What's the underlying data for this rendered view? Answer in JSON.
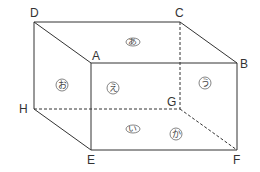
{
  "diagram": {
    "type": "rectangular-prism",
    "line_color": "#333333",
    "circle_color": "#666666",
    "vertices": {
      "A": {
        "label": "A",
        "x": 91,
        "y": 63
      },
      "B": {
        "label": "B",
        "x": 237,
        "y": 63
      },
      "C": {
        "label": "C",
        "x": 180,
        "y": 22
      },
      "D": {
        "label": "D",
        "x": 34,
        "y": 22
      },
      "E": {
        "label": "E",
        "x": 91,
        "y": 150
      },
      "F": {
        "label": "F",
        "x": 237,
        "y": 150
      },
      "G": {
        "label": "G",
        "x": 180,
        "y": 109
      },
      "H": {
        "label": "H",
        "x": 34,
        "y": 109
      }
    },
    "solid_edges": [
      "DC",
      "DA",
      "CB",
      "AB",
      "DH",
      "AE",
      "BF",
      "HE",
      "EF"
    ],
    "dashed_edges": [
      "CG",
      "HG",
      "GF"
    ],
    "faces": [
      {
        "id": "top",
        "char": "あ",
        "shape": "ellipse"
      },
      {
        "id": "bottom",
        "char": "い",
        "shape": "ellipse"
      },
      {
        "id": "right",
        "char": "う",
        "shape": "circle"
      },
      {
        "id": "front",
        "char": "え",
        "shape": "circle"
      },
      {
        "id": "left",
        "char": "お",
        "shape": "circle"
      },
      {
        "id": "back",
        "char": "か",
        "shape": "circle"
      }
    ]
  }
}
